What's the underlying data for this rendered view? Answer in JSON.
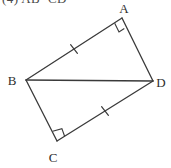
{
  "caption": {
    "text": "(4) AB=CD"
  },
  "colors": {
    "background": "#ffffff",
    "stroke": "#3a3a3a",
    "label": "#2e2e2e",
    "caption": "#4a4a4a"
  },
  "figure": {
    "type": "quadrilateral-with-diagonal",
    "vertices": [
      {
        "name": "A",
        "x": 122,
        "y": 18,
        "label": "A",
        "label_x": 124,
        "label_y": 13
      },
      {
        "name": "B",
        "x": 26,
        "y": 80,
        "label": "B",
        "label_x": 12,
        "label_y": 85
      },
      {
        "name": "C",
        "x": 57,
        "y": 141,
        "label": "C",
        "label_x": 53,
        "label_y": 162
      },
      {
        "name": "D",
        "x": 153,
        "y": 81,
        "label": "D",
        "label_x": 156,
        "label_y": 87
      }
    ],
    "edges": [
      {
        "name": "segment-AB",
        "from": "A",
        "to": "B",
        "ticks": 1
      },
      {
        "name": "segment-AD",
        "from": "A",
        "to": "D",
        "ticks": 0
      },
      {
        "name": "segment-BC",
        "from": "B",
        "to": "C",
        "ticks": 0
      },
      {
        "name": "segment-CD",
        "from": "C",
        "to": "D",
        "ticks": 1
      },
      {
        "name": "diagonal-BD",
        "from": "B",
        "to": "D",
        "ticks": 0
      }
    ],
    "right_angles": [
      {
        "name": "right-angle-A",
        "at": "A"
      },
      {
        "name": "right-angle-C",
        "at": "C"
      }
    ],
    "tick_marks": [
      {
        "name": "tick-AB",
        "on": "segment-AB",
        "cx": 74,
        "cy": 49
      },
      {
        "name": "tick-CD",
        "on": "segment-CD",
        "cx": 105,
        "cy": 111
      }
    ]
  }
}
